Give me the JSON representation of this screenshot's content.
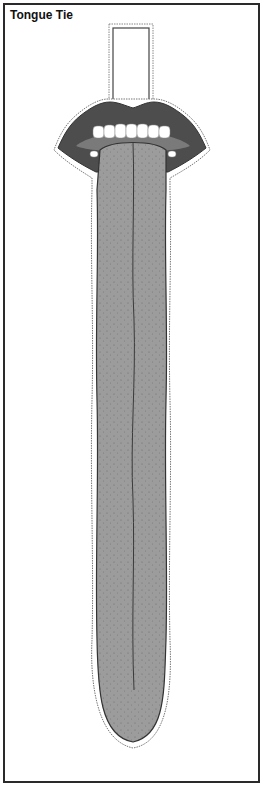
{
  "title": "Tongue Tie",
  "colors": {
    "frame": "#2a2a2a",
    "lips": "#4d4d4d",
    "tongue": "#9a9a9a",
    "tongue_shadow": "#6e6e6e",
    "teeth": "#ffffff",
    "outline": "#555555"
  },
  "parts": {
    "tab": "tab-slot",
    "lips": "lips",
    "teeth": "teeth",
    "tongue": "tongue-strip"
  }
}
